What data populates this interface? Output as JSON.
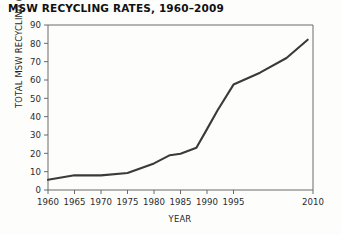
{
  "chart_data": {
    "type": "line",
    "title": "MSW RECYCLING RATES, 1960–2009",
    "xlabel": "YEAR",
    "ylabel": "TOTAL MSW RECYCLING (million tons/yr)",
    "xlim": [
      1960,
      2010
    ],
    "ylim": [
      0,
      90
    ],
    "xticks": [
      1960,
      1965,
      1970,
      1975,
      1980,
      1985,
      1990,
      1995,
      2010
    ],
    "xtick_labels": [
      "1960",
      "1965",
      "1970",
      "1975",
      "1980",
      "1985",
      "1990",
      "1995",
      "2010"
    ],
    "yticks": [
      0,
      10,
      20,
      30,
      40,
      50,
      60,
      70,
      80,
      90
    ],
    "ytick_labels": [
      "0",
      "10",
      "20",
      "30",
      "40",
      "50",
      "60",
      "70",
      "80",
      "90"
    ],
    "grid": false,
    "legend": "none",
    "line_color": "#3a3a3a",
    "series": [
      {
        "name": "Total MSW recycling",
        "x": [
          1960,
          1965,
          1970,
          1975,
          1980,
          1983,
          1985,
          1988,
          1990,
          1992,
          1995,
          2000,
          2005,
          2009
        ],
        "values": [
          5.6,
          8.0,
          8.0,
          9.3,
          14.5,
          19.0,
          19.8,
          23.0,
          33.2,
          43.5,
          57.5,
          64.0,
          72.0,
          82.0
        ]
      }
    ]
  }
}
